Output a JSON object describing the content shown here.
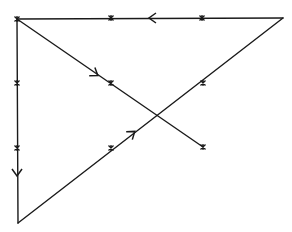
{
  "diagram": {
    "width": 292,
    "height": 232,
    "stroke_color": "#1a1a1a",
    "background": "#ffffff",
    "vertices": {
      "top_left": [
        17,
        19
      ],
      "top_right": [
        283,
        18
      ],
      "bottom_left": [
        18,
        223
      ],
      "diagonal_end": [
        203,
        147
      ]
    },
    "edges": [
      {
        "name": "top-edge",
        "from": [
          283,
          18
        ],
        "to": [
          17,
          19
        ]
      },
      {
        "name": "left-edge",
        "from": [
          17,
          19
        ],
        "to": [
          18,
          223
        ]
      },
      {
        "name": "hypotenuse-edge",
        "from": [
          18,
          223
        ],
        "to": [
          283,
          18
        ]
      },
      {
        "name": "diagonal-edge",
        "from": [
          17,
          19
        ],
        "to": [
          203,
          147
        ]
      }
    ],
    "arrows": [
      {
        "name": "top-arrow-left",
        "at": [
          150,
          18
        ],
        "direction": "left"
      },
      {
        "name": "diagonal-arrow",
        "at": [
          97,
          75
        ],
        "direction": "down-right"
      },
      {
        "name": "left-arrow-down",
        "at": [
          17,
          175
        ],
        "direction": "down"
      },
      {
        "name": "hypotenuse-arrow",
        "at": [
          134,
          132
        ],
        "direction": "up-right"
      }
    ],
    "stars": [
      {
        "name": "star-top-left-corner",
        "at": [
          17,
          19
        ]
      },
      {
        "name": "star-top-1",
        "at": [
          111,
          18
        ]
      },
      {
        "name": "star-top-2",
        "at": [
          202,
          18
        ]
      },
      {
        "name": "star-diagonal-mid",
        "at": [
          111,
          83
        ]
      },
      {
        "name": "star-diagonal-end",
        "at": [
          203,
          147
        ]
      },
      {
        "name": "star-left-1",
        "at": [
          17,
          83
        ]
      },
      {
        "name": "star-left-2",
        "at": [
          17,
          148
        ]
      },
      {
        "name": "star-hypotenuse-1",
        "at": [
          111,
          148
        ]
      },
      {
        "name": "star-hypotenuse-2",
        "at": [
          203,
          83
        ]
      }
    ]
  }
}
